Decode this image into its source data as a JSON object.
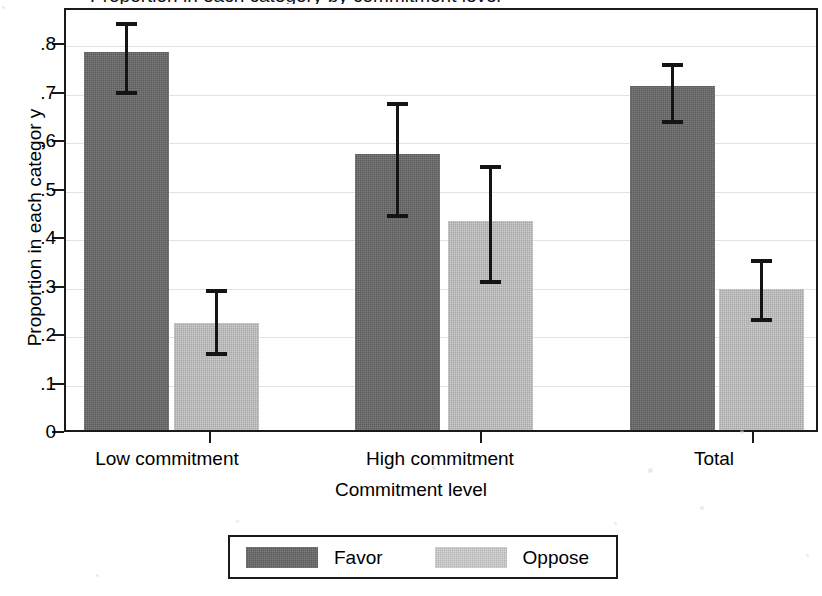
{
  "chart_data": {
    "type": "bar",
    "title": "Proportion in each category by commitment level",
    "xlabel": "Commitment level",
    "ylabel": "Proportion in each categor y",
    "categories": [
      "Low commitment",
      "High commitment",
      "Total"
    ],
    "ylim": [
      0,
      0.85
    ],
    "ytick_labels": [
      "0",
      ".1",
      ".2",
      ".3",
      ".4",
      ".5",
      ".6",
      ".7",
      ".8"
    ],
    "ytick_values": [
      0,
      0.1,
      0.2,
      0.3,
      0.4,
      0.5,
      0.6,
      0.7,
      0.8
    ],
    "grid": "horizontal",
    "legend_position": "bottom",
    "error_bars": "95% confidence interval",
    "series": [
      {
        "name": "Favor",
        "color": "#5b5b5b",
        "values": [
          0.78,
          0.57,
          0.71
        ],
        "ci_low": [
          0.7,
          0.445,
          0.64
        ],
        "ci_high": [
          0.85,
          0.685,
          0.765
        ]
      },
      {
        "name": "Oppose",
        "color": "#b4b4b4",
        "values": [
          0.22,
          0.43,
          0.29
        ],
        "ci_low": [
          0.16,
          0.31,
          0.23
        ],
        "ci_high": [
          0.3,
          0.555,
          0.36
        ]
      }
    ]
  },
  "legend": {
    "entries": [
      {
        "label": "Favor",
        "swatch": "dark-gray-swatch"
      },
      {
        "label": "Oppose",
        "swatch": "light-gray-swatch"
      }
    ]
  }
}
